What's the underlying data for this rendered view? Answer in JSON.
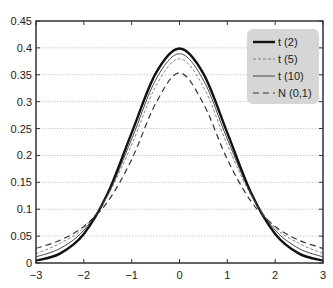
{
  "chart_data": {
    "type": "line",
    "title": "",
    "xlabel": "",
    "ylabel": "",
    "xlim": [
      -3,
      3
    ],
    "ylim": [
      0,
      0.45
    ],
    "grid": {
      "horizontal": true,
      "vertical": false,
      "style": "dotted"
    },
    "legend_position": "upper right",
    "x_ticks": [
      -3,
      -2,
      -1,
      0,
      1,
      2,
      3
    ],
    "x_tick_labels": [
      "−3",
      "−2",
      "−1",
      "0",
      "1",
      "2",
      "3"
    ],
    "y_ticks": [
      0,
      0.05,
      0.1,
      0.15,
      0.2,
      0.25,
      0.3,
      0.35,
      0.4,
      0.45
    ],
    "y_tick_labels": [
      "0",
      "0.05",
      "0.1",
      "0.15",
      "0.2",
      "0.25",
      "0.3",
      "0.35",
      "0.4",
      "0.45"
    ],
    "x": [
      -3,
      -2.5,
      -2,
      -1.5,
      -1,
      -0.5,
      0,
      0.5,
      1,
      1.5,
      2,
      2.5,
      3
    ],
    "series": [
      {
        "name": "t (2)",
        "style": "thick-solid",
        "color": "#111111",
        "values": [
          0.0044,
          0.0175,
          0.054,
          0.1295,
          0.242,
          0.3521,
          0.3989,
          0.3521,
          0.242,
          0.1295,
          0.054,
          0.0175,
          0.0044
        ]
      },
      {
        "name": "t (5)",
        "style": "thin-dashed",
        "color": "#777777",
        "values": [
          0.0173,
          0.0364,
          0.0655,
          0.1255,
          0.2197,
          0.3279,
          0.3796,
          0.3279,
          0.2197,
          0.1255,
          0.0655,
          0.0364,
          0.0173
        ]
      },
      {
        "name": "t (10)",
        "style": "thin-solid",
        "color": "#333333",
        "values": [
          0.0114,
          0.0269,
          0.0611,
          0.1274,
          0.2304,
          0.3402,
          0.3891,
          0.3402,
          0.2304,
          0.1274,
          0.0611,
          0.0269,
          0.0114
        ]
      },
      {
        "name": "N (0,1)",
        "style": "long-dashed",
        "color": "#333333",
        "values": [
          0.0272,
          0.0422,
          0.068,
          0.1141,
          0.1925,
          0.2962,
          0.3536,
          0.2962,
          0.1925,
          0.1141,
          0.068,
          0.0422,
          0.0272
        ]
      }
    ]
  },
  "colors": {
    "axis": "#333333",
    "grid": "#bbbbbb",
    "legend_bg": "#d6d6d6"
  }
}
